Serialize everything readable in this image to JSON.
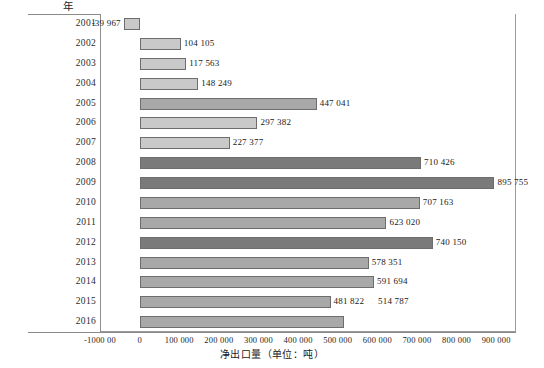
{
  "chart_data": {
    "type": "bar",
    "orientation": "horizontal",
    "title": "",
    "xlabel": "净出口量（单位：吨）",
    "ylabel": "年",
    "xlim": [
      -100000,
      950000
    ],
    "grid": false,
    "legend": null,
    "categories": [
      "2001",
      "2002",
      "2003",
      "2004",
      "2005",
      "2006",
      "2007",
      "2008",
      "2009",
      "2010",
      "2011",
      "2012",
      "2013",
      "2014",
      "2015",
      "2016"
    ],
    "values": [
      -39967,
      104105,
      117563,
      148249,
      447041,
      297382,
      227377,
      710426,
      895755,
      707163,
      623020,
      740150,
      578351,
      591694,
      481822,
      514787
    ],
    "value_labels": [
      "-39 967",
      "104 105",
      "117 563",
      "148 249",
      "447 041",
      "297 382",
      "227 377",
      "710 426",
      "895 755",
      "707 163",
      "623 020",
      "740 150",
      "578 351",
      "591 694",
      "481 822",
      "514 787"
    ],
    "xticks": [
      -100000,
      0,
      100000,
      200000,
      300000,
      400000,
      500000,
      600000,
      700000,
      800000,
      900000
    ],
    "xticklabels": [
      "-1000 00",
      "0",
      "100 000",
      "200 000",
      "300 000",
      "400 000",
      "500 000",
      "600 000",
      "700 000",
      "800 000",
      "900 000"
    ],
    "bar_shades": [
      "light",
      "light",
      "light",
      "light",
      "medium",
      "light",
      "light",
      "dark",
      "dark",
      "medium",
      "medium",
      "dark",
      "medium",
      "medium",
      "medium",
      "medium"
    ],
    "colors": {
      "light": "#c9c9c9",
      "medium": "#a8a8a8",
      "dark": "#7a7a7a",
      "bar_border": "#6d6d6d",
      "axis": "#8a8a8a",
      "text": "#1a1a1a",
      "background": "#ffffff"
    }
  }
}
